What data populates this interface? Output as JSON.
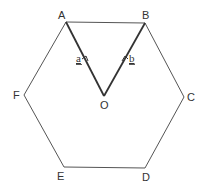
{
  "diagram": {
    "type": "regular-hexagon-with-vectors",
    "colors": {
      "outline": "#555555",
      "vector_lines": "#333333",
      "labels": "#333333",
      "background": "#ffffff"
    },
    "vertices": {
      "A": {
        "label": "A",
        "x": 66,
        "y": 22
      },
      "B": {
        "label": "B",
        "x": 145,
        "y": 23
      },
      "C": {
        "label": "C",
        "x": 184,
        "y": 97
      },
      "D": {
        "label": "D",
        "x": 145,
        "y": 168
      },
      "E": {
        "label": "E",
        "x": 64,
        "y": 167
      },
      "F": {
        "label": "F",
        "x": 24,
        "y": 95
      },
      "O": {
        "label": "O",
        "x": 104,
        "y": 96
      }
    },
    "vectors": [
      {
        "name": "a",
        "label": "a",
        "from": "O",
        "to": "A"
      },
      {
        "name": "b",
        "label": "b",
        "from": "O",
        "to": "B"
      }
    ]
  }
}
